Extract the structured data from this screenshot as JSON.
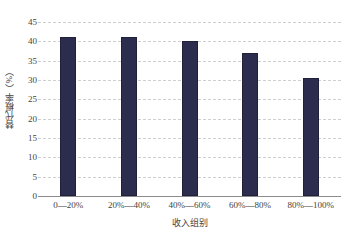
{
  "chart_data": {
    "type": "bar",
    "title": "",
    "subtitle": "",
    "xlabel": "收入组别",
    "ylabel": "替代概率（%）",
    "categories": [
      "0—20%",
      "20%—40%",
      "40%—60%",
      "60%—80%",
      "80%—100%"
    ],
    "values": [
      41,
      41,
      40,
      37,
      30.5
    ],
    "series": [
      {
        "name": "替代概率",
        "values": [
          41,
          41,
          40,
          37,
          30.5
        ]
      }
    ],
    "ylim": [
      0,
      45
    ],
    "yticks": [
      0,
      5,
      10,
      15,
      20,
      25,
      30,
      35,
      40,
      45
    ],
    "ytick_labels": [
      "0",
      "5",
      "10",
      "15",
      "20",
      "25",
      "30",
      "35",
      "40",
      "45"
    ],
    "grid": true,
    "grid_style": "dashed-horizontal",
    "legend": "none",
    "bar_color": "#2c2c4f",
    "grid_color": "#cfcfcf",
    "axis_color": "#8c8c8c"
  }
}
